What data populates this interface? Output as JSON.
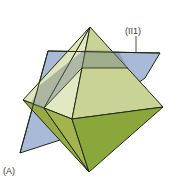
{
  "figure": {
    "panel_label": "(A)",
    "plane_label": "(īī1)"
  },
  "colors": {
    "plane": "#a9b9d8",
    "plane_over_solid": "#8f9e8c",
    "face_top_front": "#d5dda8",
    "face_top_right": "#c7d292",
    "face_top_left": "#dfe5bd",
    "face_bottom_right": "#8aa53a",
    "face_bottom_left": "#9fb04a",
    "edge": "#1f2a10"
  }
}
